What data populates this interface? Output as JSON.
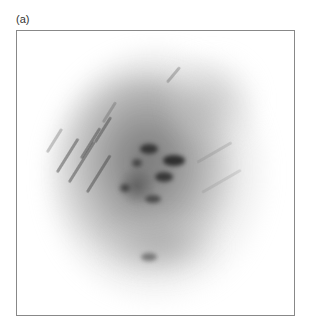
{
  "figure": {
    "panel_label": "(a)",
    "image": {
      "description": "grayscale scattering/diffraction pattern",
      "background_color": "#ffffff",
      "frame_color": "#888888",
      "main_blob": {
        "cx": 132,
        "cy": 140,
        "rx": 95,
        "ry": 110,
        "color": "#9a9a9a"
      },
      "dark_spots": [
        {
          "x": 131,
          "y": 117,
          "w": 16,
          "h": 8
        },
        {
          "x": 156,
          "y": 128,
          "w": 20,
          "h": 9
        },
        {
          "x": 124,
          "y": 130,
          "w": 10,
          "h": 7
        },
        {
          "x": 146,
          "y": 145,
          "w": 16,
          "h": 9
        },
        {
          "x": 108,
          "y": 155,
          "w": 10,
          "h": 8
        },
        {
          "x": 134,
          "y": 167,
          "w": 14,
          "h": 7
        },
        {
          "x": 115,
          "y": 140,
          "w": 26,
          "h": 28
        },
        {
          "x": 128,
          "y": 224,
          "w": 14,
          "h": 8
        }
      ]
    }
  }
}
